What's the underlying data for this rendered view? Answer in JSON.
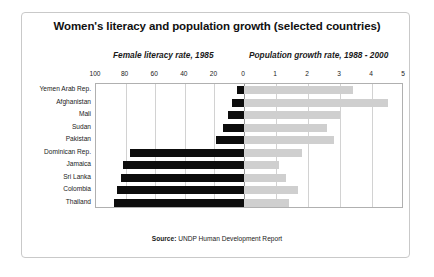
{
  "frame": {
    "name": "chart-card"
  },
  "title": "Women's literacy and population growth (selected countries)",
  "subtitle_left": "Female literacy rate, 1985",
  "subtitle_right": "Population growth rate, 1988 - 2000",
  "source_label": "Source:",
  "source_text": " UNDP Human Development Report",
  "axis": {
    "left_ticks": [
      "100",
      "80",
      "60",
      "40",
      "20"
    ],
    "center_tick": "0",
    "right_ticks": [
      "1",
      "2",
      "3",
      "4",
      "5"
    ]
  },
  "colors": {
    "literacy_bar": "#0d0d0d",
    "growth_bar": "#cfcfcf",
    "gridline": "#d2d2d2",
    "plot_border": "#b0b0b0",
    "card_border": "#c9c9c9",
    "text": "#1a1a1a",
    "background": "#ffffff"
  },
  "chart_data": {
    "type": "bar",
    "orientation": "horizontal",
    "style": "bidirectional-pyramid",
    "title": "Women's literacy and population growth (selected countries)",
    "categories": [
      "Yemen Arab Rep.",
      "Afghanistan",
      "Mali",
      "Sudan",
      "Pakistan",
      "Dominican Rep.",
      "Jamaica",
      "Sri Lanka",
      "Colombia",
      "Thailand"
    ],
    "series": [
      {
        "name": "Female literacy rate, 1985",
        "unit": "percent",
        "direction": "left",
        "axis_label": "Female literacy rate, 1985",
        "xlim": [
          0,
          100
        ],
        "ticks": [
          100,
          80,
          60,
          40,
          20,
          0
        ],
        "color": "#0d0d0d",
        "values": [
          5,
          8,
          11,
          14,
          19,
          77,
          82,
          83,
          86,
          88
        ]
      },
      {
        "name": "Population growth rate, 1988 - 2000",
        "unit": "percent per year",
        "direction": "right",
        "axis_label": "Population growth rate, 1988 - 2000",
        "xlim": [
          0,
          5
        ],
        "ticks": [
          0,
          1,
          2,
          3,
          4,
          5
        ],
        "color": "#cfcfcf",
        "values": [
          3.4,
          4.5,
          3.0,
          2.6,
          2.8,
          1.8,
          1.1,
          1.3,
          1.7,
          1.4
        ]
      }
    ],
    "grid": true,
    "legend": "none",
    "annotations": [
      "Source: UNDP Human Development Report"
    ]
  }
}
